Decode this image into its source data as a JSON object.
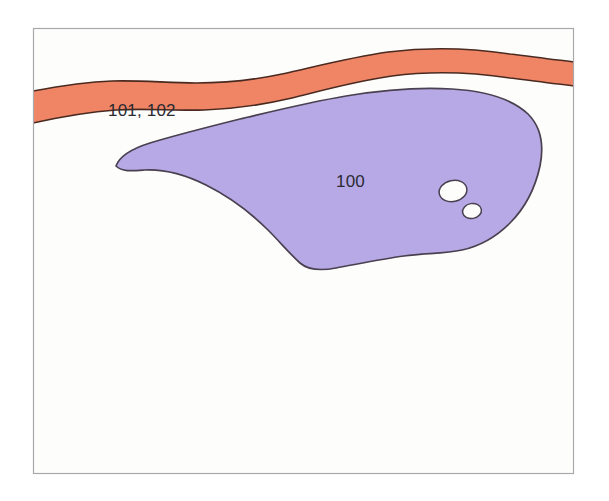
{
  "figure": {
    "background_color": "#ffffff",
    "canvas_color": "#fdfdfb",
    "frame": {
      "name": "diagram-frame",
      "stroke_color": "#a9a9ad",
      "stroke_width": 1.2,
      "x": 33,
      "y": 28,
      "width": 541,
      "height": 446
    }
  },
  "labels": {
    "upper_band": "101, 102",
    "main_body": "100"
  },
  "regions": [
    {
      "id": "region-101-102",
      "name": "upper-orange-band",
      "label": "101, 102",
      "fill_color": "#f08565",
      "stroke_color": "#4a2a20",
      "stroke_width": 1.6,
      "label_x": 108,
      "label_y": 116,
      "description": "Salmon-orange band spanning full width across the upper portion of the frame"
    },
    {
      "id": "region-100",
      "name": "main-purple-body",
      "label": "100",
      "fill_color": "#b6a9e6",
      "stroke_color": "#4a4050",
      "stroke_width": 1.6,
      "label_x": 336,
      "label_y": 187,
      "description": "Large lavender lens-shaped body below the orange band with two white inclusions"
    },
    {
      "id": "inclusion-large",
      "name": "white-inclusion-large",
      "label": "",
      "fill_color": "#fdfdfb",
      "stroke_color": "#4a4050",
      "stroke_width": 1.4,
      "description": "Larger white oval inclusion inside the purple body"
    },
    {
      "id": "inclusion-small",
      "name": "white-inclusion-small",
      "label": "",
      "fill_color": "#fdfdfb",
      "stroke_color": "#4a4050",
      "stroke_width": 1.4,
      "description": "Smaller white oval inclusion inside the purple body"
    }
  ],
  "colors": {
    "orange": "#f08565",
    "purple": "#b6a9e6",
    "outline_dark": "#4a2a20",
    "outline_purple": "#4a4050",
    "frame_gray": "#a9a9ad",
    "canvas": "#fdfdfb",
    "label_text": "#2b2b33"
  }
}
